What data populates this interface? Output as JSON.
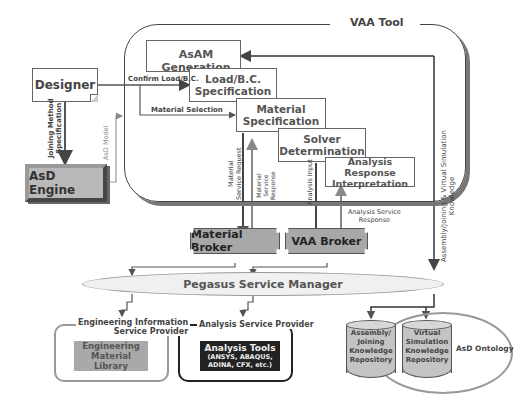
{
  "diagram": {
    "vaa_tool": {
      "label": "VAA Tool"
    },
    "designer": {
      "label": "Designer"
    },
    "asd_engine": {
      "label": "AsD Engine"
    },
    "process_steps": [
      {
        "label_line1": "AsAM Generation",
        "label_line2": ""
      },
      {
        "label_line1": "Load/B.C.",
        "label_line2": "Specification"
      },
      {
        "label_line1": "Material",
        "label_line2": "Specification"
      },
      {
        "label_line1": "Solver",
        "label_line2": "Determination"
      },
      {
        "label_line1": "Analysis Response",
        "label_line2": "Interpretation"
      }
    ],
    "brokers": [
      {
        "label": "Material Broker"
      },
      {
        "label": "VAA Broker"
      }
    ],
    "service_manager": {
      "label": "Pegasus Service Manager"
    },
    "providers": [
      {
        "title_line1": "Engineering Information",
        "title_line2": "Service Provider",
        "content_line1": "Engineering",
        "content_line2": "Material Library"
      },
      {
        "title_line1": "Analysis Service Provider",
        "title_line2": "",
        "content_line1": "Analysis Tools",
        "content_line2": "(ANSYS, ABAQUS,",
        "content_line3": "ADINA, CFX, etc.)"
      }
    ],
    "ontology": {
      "label": "AsD Ontology",
      "repositories": [
        {
          "lines": [
            "Assembly/",
            "Joining",
            "Knowledge",
            "Repository"
          ]
        },
        {
          "lines": [
            "Virtual",
            "Simulation",
            "Knowledge",
            "Repository"
          ]
        }
      ]
    },
    "edge_labels": {
      "confirm_load": "Confirm Load/B.C.",
      "material_selection": "Material Selection",
      "joining_method_line1": "Joining Method",
      "joining_method_line2": "Specification",
      "asd_model": "AsD Model",
      "material_request_line1": "Material",
      "material_request_line2": "Service Request",
      "material_response_line1": "Material",
      "material_response_line2": "Service",
      "material_response_line3": "Response",
      "analysis_input": "Analysis Input",
      "analysis_response_line1": "Analysis Service",
      "analysis_response_line2": "Response",
      "knowledge_line1": "Assembly/Joining & Virtual Simulation",
      "knowledge_line2": "Knowledge"
    }
  }
}
